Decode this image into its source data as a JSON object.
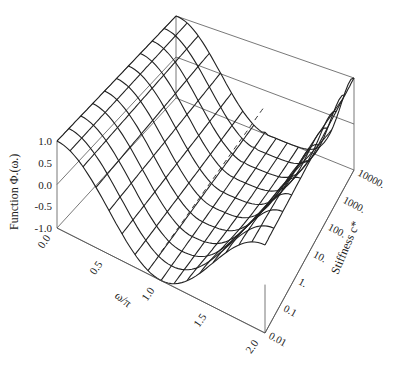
{
  "chart_data": {
    "type": "surface3d",
    "title": "",
    "xlabel": "ω/π",
    "ylabel": "Stiffness c*",
    "zlabel": "Function Φ.(ω.)",
    "x_ticks": [
      "0.0",
      "0.5",
      "1.0",
      "1.5",
      "2.0"
    ],
    "x_range": [
      0,
      2
    ],
    "y_ticks": [
      "0.01",
      "0.1",
      "1.",
      "10.",
      "100.",
      "1000.",
      "10000."
    ],
    "y_scale": "log",
    "y_range": [
      0.01,
      10000
    ],
    "z_ticks": [
      "-1.0",
      "-0.5",
      "0.0",
      "0.5",
      "1.0"
    ],
    "z_range": [
      -1,
      1
    ],
    "grid_x_count": 17,
    "grid_y_count": 11,
    "line_color": "#222222",
    "box_color": "#555555"
  }
}
